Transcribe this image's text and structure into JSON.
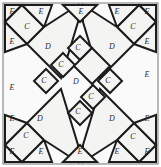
{
  "figure": {
    "shape": "square",
    "width": 161,
    "height": 167,
    "symmetry": "4-fold rotational",
    "colors": {
      "piece_fill": "#f4f4f2",
      "piece_stroke": "#1c1c1c",
      "frame_stroke": "#8d8d8d",
      "background": "#ffffff",
      "label": "#2a2a2a"
    },
    "piece_types": [
      {
        "key": "C",
        "label": "C",
        "shape": "square-diamond",
        "count": 12
      },
      {
        "key": "D",
        "label": "D",
        "shape": "rectangle",
        "count": 6
      },
      {
        "key": "E",
        "label": "E",
        "shape": "right-triangle",
        "count": 12
      },
      {
        "key": "F",
        "label": "F",
        "shape": "small-corner-triangle",
        "count": 4
      }
    ],
    "labels": [
      {
        "text": "F",
        "x": 12,
        "y": 12
      },
      {
        "text": "E",
        "x": 41,
        "y": 12
      },
      {
        "text": "E",
        "x": 12,
        "y": 42
      },
      {
        "text": "C",
        "x": 27,
        "y": 27
      },
      {
        "text": "D",
        "x": 48,
        "y": 47
      },
      {
        "text": "E",
        "x": 81,
        "y": 12
      },
      {
        "text": "E",
        "x": 117,
        "y": 12
      },
      {
        "text": "F",
        "x": 147,
        "y": 12
      },
      {
        "text": "C",
        "x": 133,
        "y": 27
      },
      {
        "text": "E",
        "x": 147,
        "y": 42
      },
      {
        "text": "D",
        "x": 112,
        "y": 47
      },
      {
        "text": "E",
        "x": 147,
        "y": 75
      },
      {
        "text": "E",
        "x": 12,
        "y": 88
      },
      {
        "text": "C",
        "x": 78,
        "y": 48
      },
      {
        "text": "C",
        "x": 61,
        "y": 65
      },
      {
        "text": "C",
        "x": 44,
        "y": 81
      },
      {
        "text": "D",
        "x": 76,
        "y": 82
      },
      {
        "text": "C",
        "x": 108,
        "y": 81
      },
      {
        "text": "C",
        "x": 91,
        "y": 97
      },
      {
        "text": "C",
        "x": 78,
        "y": 112
      },
      {
        "text": "D",
        "x": 40,
        "y": 119
      },
      {
        "text": "E",
        "x": 12,
        "y": 119
      },
      {
        "text": "C",
        "x": 26,
        "y": 136
      },
      {
        "text": "F",
        "x": 12,
        "y": 152
      },
      {
        "text": "E",
        "x": 41,
        "y": 152
      },
      {
        "text": "E",
        "x": 80,
        "y": 152
      },
      {
        "text": "D",
        "x": 112,
        "y": 119
      },
      {
        "text": "E",
        "x": 147,
        "y": 119
      },
      {
        "text": "C",
        "x": 133,
        "y": 137
      },
      {
        "text": "E",
        "x": 117,
        "y": 152
      },
      {
        "text": "F",
        "x": 147,
        "y": 152
      }
    ],
    "pieces": [
      {
        "name": "corner-triangle-top-left",
        "type": "F",
        "points": "5,5 22,5 5,22"
      },
      {
        "name": "diamond-top-left",
        "type": "C",
        "points": "22,5 44,27 27,44 5,22"
      },
      {
        "name": "edge-triangle-top-left",
        "type": "E",
        "points": "22,5 52,5 44,27"
      },
      {
        "name": "edge-triangle-left-upper",
        "type": "E",
        "points": "5,22 27,44 5,52"
      },
      {
        "name": "rect-top-left",
        "type": "D",
        "points": "44,27 78,5 78,22 61,78 27,44"
      },
      {
        "name": "corner-triangle-top-right",
        "type": "F",
        "points": "156,5 139,5 156,22"
      },
      {
        "name": "diamond-top-right",
        "type": "C",
        "points": "139,5 117,27 134,44 156,22"
      },
      {
        "name": "edge-triangle-top-right",
        "type": "E",
        "points": "139,5 109,5 117,27"
      },
      {
        "name": "edge-triangle-right-upper",
        "type": "E",
        "points": "156,22 134,44 156,52"
      },
      {
        "name": "rect-top-right",
        "type": "D",
        "points": "117,27 83,5 83,22 100,78 134,44"
      },
      {
        "name": "corner-triangle-bottom-left",
        "type": "F",
        "points": "5,162 22,162 5,145"
      },
      {
        "name": "diamond-bottom-left",
        "type": "C",
        "points": "22,162 44,140 27,123 5,145"
      },
      {
        "name": "edge-triangle-bottom-left",
        "type": "E",
        "points": "22,162 52,162 44,140"
      },
      {
        "name": "edge-triangle-left-lower",
        "type": "E",
        "points": "5,145 27,123 5,115"
      },
      {
        "name": "rect-bottom-left",
        "type": "D",
        "points": "44,140 78,162 78,145 61,89 27,123"
      },
      {
        "name": "corner-triangle-bottom-right",
        "type": "F",
        "points": "156,162 139,162 156,145"
      },
      {
        "name": "diamond-bottom-right",
        "type": "C",
        "points": "139,162 117,140 134,123 156,145"
      },
      {
        "name": "edge-triangle-bottom-right",
        "type": "E",
        "points": "139,162 109,162 117,140"
      },
      {
        "name": "edge-triangle-right-lower",
        "type": "E",
        "points": "156,145 134,123 156,115"
      },
      {
        "name": "rect-bottom-right",
        "type": "D",
        "points": "117,140 83,162 83,145 100,89 134,123"
      },
      {
        "name": "edge-triangle-top-center",
        "type": "E",
        "points": "63,5 97,5 80,22"
      },
      {
        "name": "edge-triangle-bottom-center",
        "type": "E",
        "points": "63,162 97,162 80,145"
      },
      {
        "name": "diamond-center-1",
        "type": "C",
        "points": "80,36 92,48 80,60 68,48"
      },
      {
        "name": "diamond-center-2",
        "type": "C",
        "points": "63,53 75,65 63,77 51,65"
      },
      {
        "name": "diamond-center-3",
        "type": "C",
        "points": "46,69 58,81 46,93 34,81"
      },
      {
        "name": "diamond-center-4",
        "type": "C",
        "points": "110,69 122,81 110,93 98,81"
      },
      {
        "name": "diamond-center-5",
        "type": "C",
        "points": "93,85 105,97 93,109 81,97"
      },
      {
        "name": "diamond-center-6",
        "type": "C",
        "points": "80,101 92,113 80,125 68,113"
      },
      {
        "name": "rect-center-main",
        "type": "D",
        "points": "92,48 110,66 92,84 74,66"
      }
    ]
  }
}
